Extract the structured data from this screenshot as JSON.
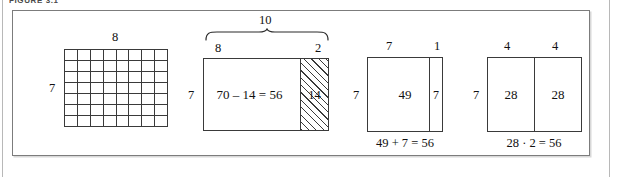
{
  "figure": {
    "caption": "FIGURE 3.1",
    "frame_color": "#7c7c7c",
    "ink_color": "#3a3a3a"
  },
  "panels": [
    {
      "id": "array",
      "name": "unit-square-array",
      "top_label": "8",
      "left_label": "7",
      "grid": {
        "columns": 8,
        "rows": 7
      }
    },
    {
      "id": "subtract",
      "name": "ten-minus-two-model",
      "brace_label": "10",
      "top_label_left": "8",
      "top_label_right": "2",
      "left_label": "7",
      "body_expression": "70 – 14 = 56",
      "hatched_label": "14"
    },
    {
      "id": "split",
      "name": "seven-plus-one-model",
      "top_label_left": "7",
      "top_label_right": "1",
      "left_label": "7",
      "body_label": "49",
      "strip_label": "7",
      "caption": "49 + 7 = 56"
    },
    {
      "id": "double",
      "name": "double-four-model",
      "top_label_left": "4",
      "top_label_right": "4",
      "left_label": "7",
      "body_label_left": "28",
      "body_label_right": "28",
      "caption": "28 · 2 = 56"
    }
  ]
}
